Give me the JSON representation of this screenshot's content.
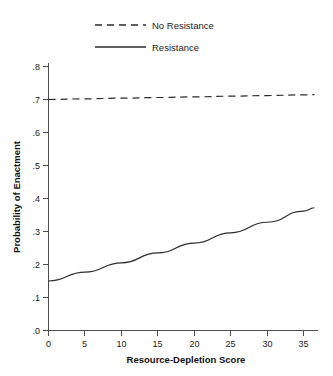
{
  "chart_data": {
    "type": "line",
    "title": "",
    "xlabel": "Resource-Depletion Score",
    "ylabel": "Probability of Enactment",
    "xlim": [
      0,
      37
    ],
    "ylim": [
      0.0,
      0.85
    ],
    "grid": false,
    "legend_position": "top",
    "xticks": [
      0,
      5,
      10,
      15,
      20,
      25,
      30,
      35
    ],
    "xticklabels": [
      "0",
      "5",
      "10",
      "15",
      "20",
      "25",
      "30",
      "35"
    ],
    "yticks": [
      0.0,
      0.1,
      0.2,
      0.3,
      0.4,
      0.5,
      0.6,
      0.7,
      0.8
    ],
    "yticklabels": [
      ".0",
      ".1",
      ".2",
      ".3",
      ".4",
      ".5",
      ".6",
      ".7",
      ".8"
    ],
    "x": [
      0,
      5,
      10,
      15,
      20,
      25,
      30,
      35,
      36.5
    ],
    "series": [
      {
        "name": "No Resistance",
        "style": "dashed",
        "color": "#2b2b2b",
        "values": [
          0.7,
          0.702,
          0.704,
          0.706,
          0.708,
          0.71,
          0.712,
          0.714,
          0.715
        ]
      },
      {
        "name": "Resistance",
        "style": "solid",
        "color": "#2b2b2b",
        "values": [
          0.15,
          0.177,
          0.205,
          0.235,
          0.265,
          0.296,
          0.328,
          0.362,
          0.372
        ]
      }
    ]
  },
  "legend": {
    "entries": [
      {
        "label": "No Resistance",
        "style": "dashed"
      },
      {
        "label": "Resistance",
        "style": "solid"
      }
    ]
  },
  "axes": {
    "x_title": "Resource-Depletion Score",
    "y_title": "Probability of Enactment"
  }
}
